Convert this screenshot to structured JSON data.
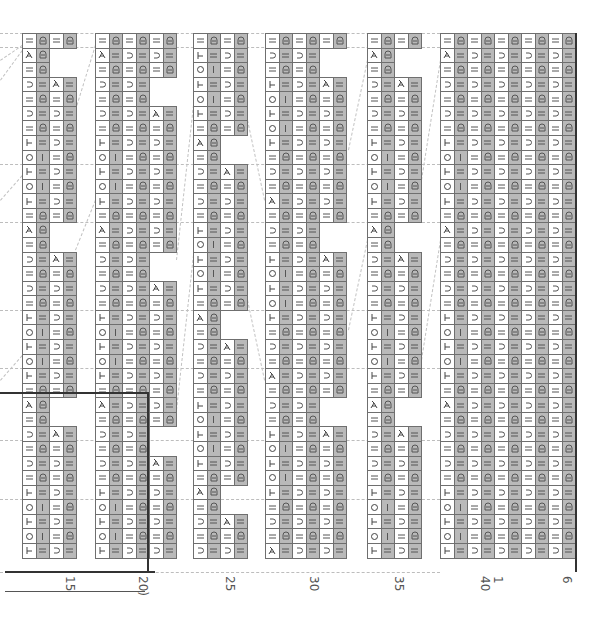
{
  "chart": {
    "top": 33,
    "row_height": 14.57,
    "col_width": 13.5,
    "rows": 37,
    "colors": {
      "shaded": "#b9b9b9",
      "grid": "#6f6f6f",
      "symbol": "#444444",
      "rule": "#333333",
      "guide": "#bdbdbd"
    },
    "symbols": {
      "-": "knit (=)",
      "D": "purl-cluster (Ɑ)",
      "U": "slip (⊃)",
      "X": "decrease (⅄)",
      "O": "yarn over (○)",
      "T": "start of twist (⊢)",
      "I": "single bar (|)"
    },
    "blocks": [
      {
        "name": "block-1",
        "x": 22,
        "cols": 4,
        "rows": [
          "-D-D",
          "XD  ",
          "-D  ",
          "U-X-",
          "-D-D",
          "U-U-",
          "-D-D",
          "T-U-",
          "OI-D",
          "T-U-",
          "OI-D",
          "T-U-",
          "-D-D",
          "XD  ",
          "-D  ",
          "U-X-",
          "-D-D",
          "U-U-",
          "-D-D",
          "T-U-",
          "OI-D",
          "T-U-",
          "OI-D",
          "T-U-",
          "-D-D",
          "XD  ",
          "-D  ",
          "U-X-",
          "-D-D",
          "U-U-",
          "-D-D",
          "T-U-",
          "OI-D",
          "T-U-",
          "OI-D",
          "T-U-",
          "    "
        ]
      },
      {
        "name": "block-2",
        "x": 95,
        "cols": 6,
        "rows": [
          "-D-D-D",
          "X-U-U-",
          "-D-D-D",
          "U-U-  ",
          "-D-D  ",
          "U-U-X-",
          "-D-D-D",
          "T-U-U-",
          "OI-D-D",
          "T-U-U-",
          "OI-D-D",
          "T-U-U-",
          "-D-D-D",
          "X-U-U-",
          "-D-D-D",
          "U-U-  ",
          "-D-D  ",
          "U-U-X-",
          "-D-D-D",
          "T-U-U-",
          "OI-D-D",
          "T-U-U-",
          "OI-D-D",
          "T-U-U-",
          "-D-D-D",
          "X-U-U-",
          "-D-D-D",
          "U-U-  ",
          "-D-D  ",
          "U-U-X-",
          "-D-D-D",
          "T-U-U-",
          "OI-D-D",
          "T-U-U-",
          "OI-D-D",
          "T-U-U-",
          "      "
        ]
      },
      {
        "name": "block-3",
        "x": 193,
        "cols": 4,
        "rows": [
          "-D-D",
          "T-U-",
          "OI-D",
          "T-U-",
          "OI-D",
          "T-U-",
          "-D-D",
          "XD  ",
          "-D  ",
          "U-X-",
          "-D-D",
          "U-U-",
          "-D-D",
          "T-U-",
          "OI-D",
          "T-U-",
          "OI-D",
          "T-U-",
          "-D-D",
          "XD  ",
          "-D  ",
          "U-X-",
          "-D-D",
          "U-U-",
          "-D-D",
          "T-U-",
          "OI-D",
          "T-U-",
          "OI-D",
          "T-U-",
          "-D-D",
          "XD  ",
          "-D  ",
          "U-X-",
          "-D-D",
          "U-U-",
          "    "
        ]
      },
      {
        "name": "block-4",
        "x": 265,
        "cols": 6,
        "rows": [
          "-D-D-D",
          "U-U-  ",
          "-D-D  ",
          "T-U-X-",
          "OI-D-D",
          "T-U-U-",
          "OI-D-D",
          "T-U-U-",
          "-D-D-D",
          "U-U-U-",
          "-D-D-D",
          "X-U-U-",
          "-D-D-D",
          "U-U-  ",
          "-D-D  ",
          "T-U-X-",
          "OI-D-D",
          "T-U-U-",
          "OI-D-D",
          "T-U-U-",
          "-D-D-D",
          "U-U-U-",
          "-D-D-D",
          "X-U-U-",
          "-D-D-D",
          "U-U-  ",
          "-D-D  ",
          "T-U-X-",
          "OI-D-D",
          "T-U-U-",
          "OI-D-D",
          "T-U-U-",
          "-D-D-D",
          "U-U-U-",
          "-D-D-D",
          "X-U-U-",
          "      "
        ]
      },
      {
        "name": "block-5",
        "x": 367,
        "cols": 4,
        "rows": [
          "-D-D",
          "XD  ",
          "-D  ",
          "U-X-",
          "-D-D",
          "U-U-",
          "-D-D",
          "T-U-",
          "OI-D",
          "T-U-",
          "OI-D",
          "T-U-",
          "-D-D",
          "XD  ",
          "-D  ",
          "U-X-",
          "-D-D",
          "U-U-",
          "-D-D",
          "T-U-",
          "OI-D",
          "T-U-",
          "OI-D",
          "T-U-",
          "-D-D",
          "XD  ",
          "-D  ",
          "U-X-",
          "-D-D",
          "U-U-",
          "-D-D",
          "T-U-",
          "OI-D",
          "T-U-",
          "OI-D",
          "T-U-",
          "    "
        ]
      },
      {
        "name": "block-6",
        "x": 440,
        "cols": 10,
        "rows": [
          "-D-D-D-D-D",
          "X-U-U-U-U-",
          "-D-D-D-D-D",
          "U-U-U-U-U-",
          "-D-D-D-D-D",
          "U-U-U-U-U-",
          "-D-D-D-D-D",
          "T-U-U-U-U-",
          "OI-D-D-D-D",
          "T-U-U-U-U-",
          "OI-D-D-D-D",
          "T-U-U-U-U-",
          "-D-D-D-D-D",
          "X-U-U-U-U-",
          "-D-D-D-D-D",
          "U-U-U-U-U-",
          "-D-D-D-D-D",
          "U-U-U-U-U-",
          "-D-D-D-D-D",
          "T-U-U-U-U-",
          "OI-D-D-D-D",
          "T-U-U-U-U-",
          "OI-D-D-D-D",
          "T-U-U-U-U-",
          "-D-D-D-D-D",
          "X-U-U-U-U-",
          "-D-D-D-D-D",
          "U-U-U-U-U-",
          "-D-D-D-D-D",
          "U-U-U-U-U-",
          "-D-D-D-D-D",
          "T-U-U-U-U-",
          "OI-D-D-D-D",
          "T-U-U-U-U-",
          "OI-D-D-D-D",
          "T-U-U-U-U-",
          "          "
        ]
      }
    ],
    "stitch_labels": [
      {
        "text": "15",
        "x": 69
      },
      {
        "text": "20)",
        "x": 142
      },
      {
        "text": "25",
        "x": 229
      },
      {
        "text": "30",
        "x": 313
      },
      {
        "text": "35",
        "x": 398
      },
      {
        "text": "40",
        "x": 484
      },
      {
        "text": "1",
        "x": 497
      },
      {
        "text": "6",
        "x": 566
      }
    ],
    "rules": {
      "section_line_y": 393,
      "section_line_x_end": 148,
      "base_line_y": 572,
      "bracket_line_y": 591
    }
  }
}
